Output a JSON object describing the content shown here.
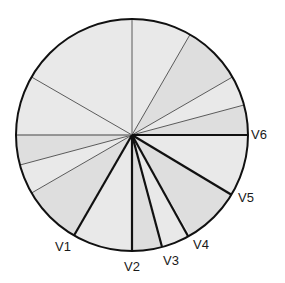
{
  "diagram": {
    "type": "precordial-lead-axes",
    "center": [
      132,
      135
    ],
    "radius": 116,
    "colors": {
      "fill_light": "#e9e9e9",
      "fill_dark": "#dedede",
      "thin_line": "#4a4a4a",
      "thick_line": "#111111",
      "outline": "#111111"
    },
    "sectors": [
      {
        "from": -90,
        "to": -60,
        "shade": "light"
      },
      {
        "from": -60,
        "to": -30,
        "shade": "dark"
      },
      {
        "from": -30,
        "to": -15,
        "shade": "light"
      },
      {
        "from": -15,
        "to": 0,
        "shade": "dark"
      },
      {
        "from": 0,
        "to": 30,
        "shade": "light"
      },
      {
        "from": 30,
        "to": 60,
        "shade": "dark"
      },
      {
        "from": 60,
        "to": 75,
        "shade": "light"
      },
      {
        "from": 75,
        "to": 90,
        "shade": "dark"
      },
      {
        "from": 90,
        "to": 120,
        "shade": "light"
      },
      {
        "from": 120,
        "to": 150,
        "shade": "dark"
      },
      {
        "from": 150,
        "to": 165,
        "shade": "light"
      },
      {
        "from": 165,
        "to": 180,
        "shade": "dark"
      },
      {
        "from": 180,
        "to": 210,
        "shade": "light"
      },
      {
        "from": 210,
        "to": 270,
        "shade": "light"
      }
    ],
    "thin_lines": [
      -90,
      -60,
      -30,
      -15,
      150,
      165,
      210
    ],
    "gray_line": 180,
    "leads": [
      {
        "label": "V1",
        "angle": 120,
        "label_pos": [
          55,
          251
        ]
      },
      {
        "label": "V2",
        "angle": 90,
        "label_pos": [
          124,
          271
        ]
      },
      {
        "label": "V3",
        "angle": 75,
        "label_pos": [
          163,
          265
        ]
      },
      {
        "label": "V4",
        "angle": 61,
        "label_pos": [
          193,
          249
        ]
      },
      {
        "label": "V5",
        "angle": 31,
        "label_pos": [
          238,
          202
        ]
      },
      {
        "label": "V6",
        "angle": 0,
        "label_pos": [
          251,
          139
        ]
      }
    ]
  }
}
